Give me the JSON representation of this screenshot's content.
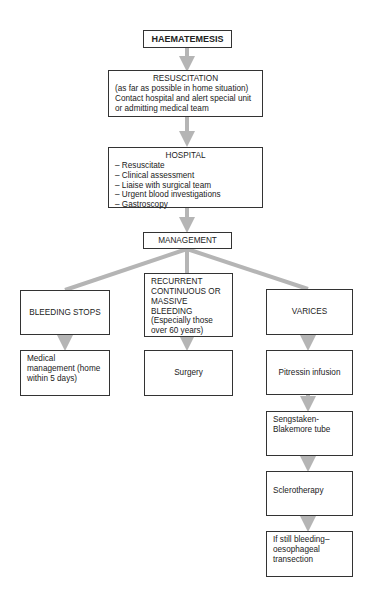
{
  "nodes": {
    "haematemesis": "HAEMATEMESIS",
    "resuscitation": {
      "heading": "RESUSCITATION",
      "body": "(as far as possible in home situation) Contact hospital and alert special unit or admitting medical team"
    },
    "hospital": {
      "heading": "HOSPITAL",
      "items": [
        "Resuscitate",
        "Clinical assessment",
        "Liaise with surgical team",
        "Urgent blood investigations",
        "Gastroscopy"
      ]
    },
    "management": "MANAGEMENT",
    "bleeding_stops": "BLEEDING STOPS",
    "recurrent": "RECURRENT CONTINUOUS OR MASSIVE BLEEDING (Especially those over 60 years)",
    "varices": "VARICES",
    "medical_management": "Medical management (home within 5 days)",
    "surgery": "Surgery",
    "pitressin": "Pitressin infusion",
    "sengstaken": "Sengstaken-Blakemore tube",
    "sclerotherapy": "Sclerotherapy",
    "transection": "If still bleeding–oesophageal transection"
  },
  "colors": {
    "arrow": "#b5b5b5",
    "border": "#333333"
  }
}
